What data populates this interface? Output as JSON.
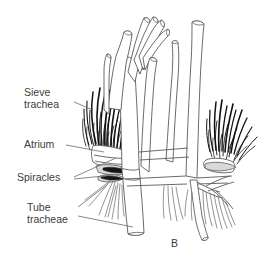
{
  "figure": {
    "letter": "B",
    "background_color": "#ffffff",
    "outline_color": "#5a5a5a",
    "bristle_color": "#111111",
    "label_color": "#3c3c3c",
    "spiracle_dark_color": "#15161a",
    "spiracle_pale_color": "#d9d9dd"
  },
  "labels": [
    {
      "id": "sieve-trachea",
      "line1": "Sieve",
      "line2": "trachea",
      "x": 24,
      "y": 96,
      "leader": "M 74 102 L 93 110"
    },
    {
      "id": "atrium",
      "line1": "Atrium",
      "line2": "",
      "x": 24,
      "y": 148,
      "leader": "M 66 145 L 104 152"
    },
    {
      "id": "spiracles",
      "line1": "Spiracles",
      "line2": "",
      "x": 17,
      "y": 180,
      "leader_a": "M 74 177 L 116 158",
      "leader_b": "M 74 179 L 113 175"
    },
    {
      "id": "tube-tracheae",
      "line1": "Tube",
      "line2": "tracheae",
      "x": 27,
      "y": 211,
      "leader_a": "M 78 207 L 107 185",
      "leader_b": "M 78 216 L 133 227"
    }
  ]
}
